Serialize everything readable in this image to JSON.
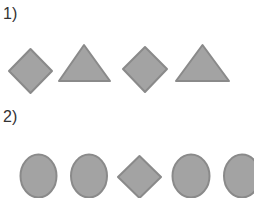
{
  "problems": [
    {
      "label": "1)",
      "shapes": [
        "diamond",
        "triangle",
        "diamond",
        "triangle"
      ]
    },
    {
      "label": "2)",
      "shapes": [
        "ellipse",
        "ellipse",
        "diamond",
        "ellipse",
        "ellipse"
      ]
    }
  ],
  "colors": {
    "fill": "#a3a3a3",
    "stroke": "#8a8a8a",
    "text": "#333333"
  }
}
